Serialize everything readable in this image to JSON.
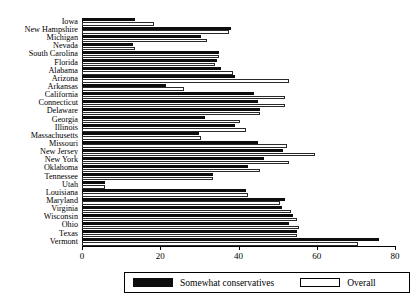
{
  "chart_data": {
    "type": "bar",
    "orientation": "horizontal",
    "title": "",
    "xlabel": "",
    "ylabel": "",
    "xlim": [
      0,
      80
    ],
    "xticks": [
      0,
      20,
      40,
      60,
      80
    ],
    "grid": false,
    "legend_position": "bottom",
    "categories": [
      "Iowa",
      "New Hampshire",
      "Michigan",
      "Nevada",
      "South Carolina",
      "Florida",
      "Alabama",
      "Arizona",
      "Arkansas",
      "California",
      "Connecticut",
      "Delaware",
      "Georgia",
      "Illinois",
      "Massachusetts",
      "Missouri",
      "New Jersey",
      "New York",
      "Oklahoma",
      "Tennessee",
      "Utah",
      "Louisiana",
      "Maryland",
      "Virginia",
      "Wisconsin",
      "Ohio",
      "Texas",
      "Vermont"
    ],
    "series": [
      {
        "name": "Somewhat conservatives",
        "color": "#0d0d0d",
        "values": [
          13.5,
          38.0,
          30.5,
          13.0,
          35.0,
          34.5,
          35.5,
          39.0,
          21.5,
          44.0,
          45.0,
          45.5,
          31.5,
          39.0,
          30.0,
          45.0,
          51.5,
          46.5,
          42.5,
          33.5,
          6.0,
          42.0,
          52.0,
          51.0,
          54.0,
          53.0,
          55.0,
          76.0
        ]
      },
      {
        "name": "Overall",
        "color": "#ffffff",
        "values": [
          18.5,
          37.5,
          32.0,
          13.5,
          35.0,
          34.0,
          38.5,
          53.0,
          26.0,
          52.0,
          52.0,
          45.5,
          40.5,
          42.0,
          30.5,
          52.5,
          59.5,
          53.0,
          45.5,
          33.5,
          6.0,
          42.5,
          50.5,
          53.5,
          55.0,
          55.5,
          55.0,
          70.5
        ]
      }
    ]
  },
  "legend": {
    "series_dark_label": "Somewhat conservatives",
    "series_light_label": "Overall"
  },
  "axis": {
    "tick_labels": [
      "0",
      "20",
      "40",
      "60",
      "80"
    ]
  }
}
